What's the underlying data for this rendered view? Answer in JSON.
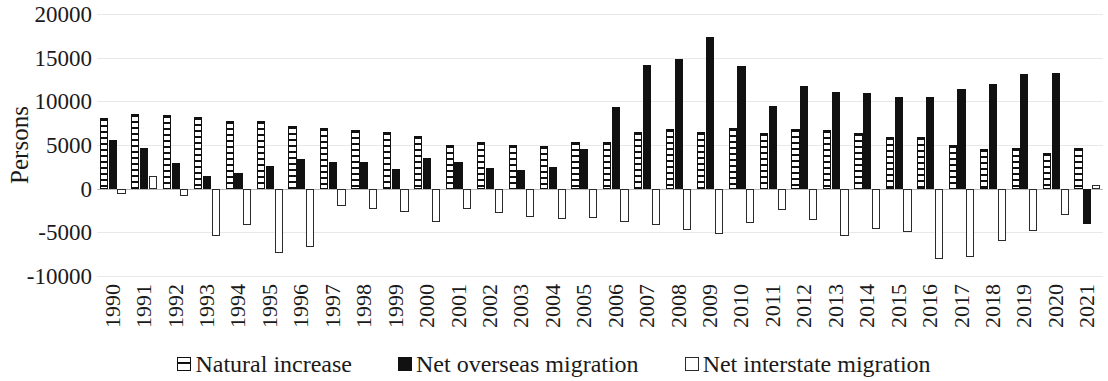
{
  "chart_data": {
    "type": "bar",
    "title": "",
    "subtitle": "",
    "xlabel": "",
    "ylabel": "Persons",
    "ylim": [
      -10000,
      20000
    ],
    "ytick_step": 5000,
    "yticks": [
      20000,
      15000,
      10000,
      5000,
      0,
      -5000,
      -10000
    ],
    "ytick_labels": [
      "20000",
      "15000",
      "10000",
      "5000",
      "0",
      "-5000",
      "-10000"
    ],
    "grid": true,
    "legend_position": "bottom",
    "categories": [
      "1990",
      "1991",
      "1992",
      "1993",
      "1994",
      "1995",
      "1996",
      "1997",
      "1998",
      "1999",
      "2000",
      "2001",
      "2002",
      "2003",
      "2004",
      "2005",
      "2006",
      "2007",
      "2008",
      "2009",
      "2010",
      "2011",
      "2012",
      "2013",
      "2014",
      "2015",
      "2016",
      "2017",
      "2018",
      "2019",
      "2020",
      "2021"
    ],
    "series": [
      {
        "name": "Natural increase",
        "pattern": "hatched",
        "color": "#111111",
        "values": [
          8100,
          8600,
          8400,
          8200,
          7800,
          7800,
          7200,
          6900,
          6700,
          6500,
          6000,
          5000,
          5400,
          5000,
          4900,
          5400,
          5300,
          6500,
          6800,
          6500,
          6900,
          6400,
          6800,
          6700,
          6400,
          5900,
          5900,
          5000,
          4500,
          4600,
          4100,
          4700
        ]
      },
      {
        "name": "Net overseas migration",
        "pattern": "solid",
        "color": "#111111",
        "values": [
          5600,
          4600,
          2900,
          1500,
          1800,
          2600,
          3400,
          3000,
          3100,
          2300,
          3500,
          3000,
          2400,
          2100,
          2500,
          4500,
          9400,
          14200,
          14900,
          17400,
          14000,
          9500,
          11800,
          11100,
          11000,
          10500,
          10500,
          11400,
          12000,
          13100,
          13200,
          -4000
        ]
      },
      {
        "name": "Net interstate migration",
        "pattern": "hollow",
        "color": "#2b2b2b",
        "values": [
          -600,
          1400,
          -800,
          -5400,
          -4200,
          -7400,
          -6700,
          -2000,
          -2300,
          -2700,
          -3800,
          -2300,
          -2800,
          -3200,
          -3500,
          -3400,
          -3800,
          -4200,
          -4700,
          -5200,
          -3900,
          -2400,
          -3600,
          -5400,
          -4600,
          -5000,
          -8100,
          -7800,
          -6000,
          -4800,
          -3000,
          400
        ]
      }
    ]
  },
  "legend": {
    "items": [
      {
        "label": "Natural increase",
        "swatch": "hatched-square-icon"
      },
      {
        "label": "Net overseas migration",
        "swatch": "filled-square-icon"
      },
      {
        "label": "Net interstate migration",
        "swatch": "hollow-square-icon"
      }
    ]
  }
}
